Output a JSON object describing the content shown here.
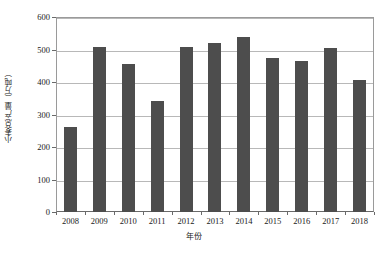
{
  "chart_data": {
    "type": "bar",
    "title": "",
    "xlabel": "年份",
    "ylabel": "小麦总产量（万吨）",
    "categories": [
      "2008",
      "2009",
      "2010",
      "2011",
      "2012",
      "2013",
      "2014",
      "2015",
      "2016",
      "2017",
      "2018"
    ],
    "values": [
      261,
      508,
      455,
      341,
      508,
      520,
      538,
      473,
      464,
      506,
      406
    ],
    "ylim": [
      0,
      600
    ],
    "yticks": [
      0,
      100,
      200,
      300,
      400,
      500,
      600
    ],
    "ytick_labels": [
      "0",
      "100",
      "200",
      "300",
      "400",
      "500",
      "600"
    ],
    "grid": true,
    "legend": "none",
    "series_color": "#4d4d4d",
    "background_color": "#ffffff",
    "gridline_color": "#b8b8b8",
    "axis_color": "#6a6a6a"
  }
}
